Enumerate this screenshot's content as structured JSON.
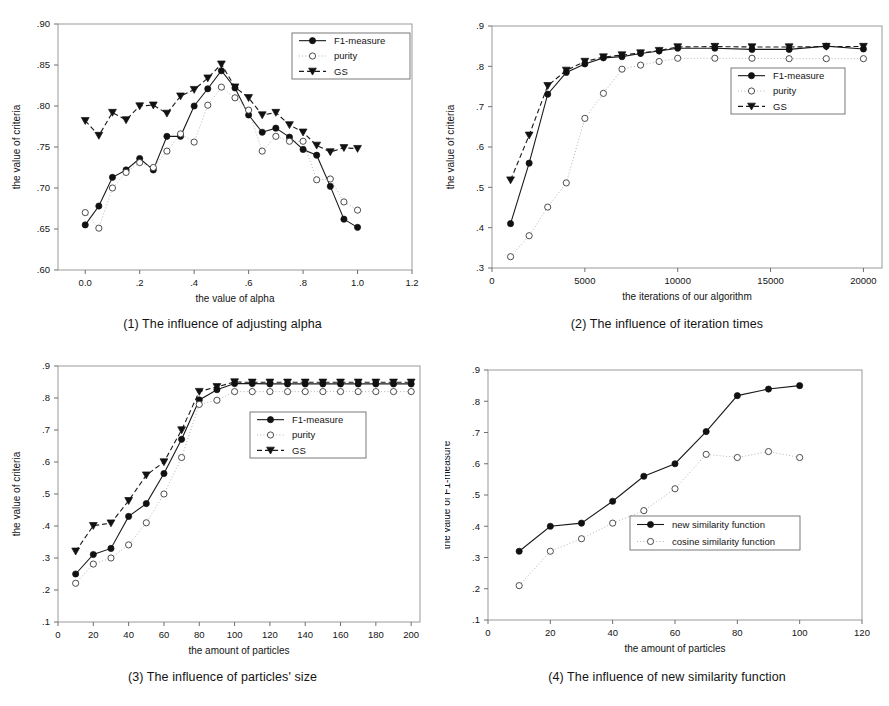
{
  "figure": {
    "title_present": false,
    "panel_count": 4,
    "ink_color": "#141414",
    "dotted_color": "#b4b4b4",
    "frame_color": "#9a9a9a"
  },
  "series_style_names": {
    "solid_filled_circle": "F1-measure",
    "dotted_open_circle": "purity",
    "dashed_filled_triangle": "GS"
  },
  "panels": [
    {
      "id": "panel-1",
      "caption": "(1) The influence of adjusting alpha"
    },
    {
      "id": "panel-2",
      "caption": "(2) The influence of iteration times"
    },
    {
      "id": "panel-3",
      "caption": "(3) The influence of particles' size"
    },
    {
      "id": "panel-4",
      "caption": "(4) The influence of new similarity function"
    }
  ],
  "chart_data": [
    {
      "type": "line",
      "id": "chart-1",
      "title": "(1) The influence of adjusting alpha",
      "xlabel": "the value of alpha",
      "ylabel": "the value of criteria",
      "xlim": [
        -0.1,
        1.2
      ],
      "ylim": [
        0.6,
        0.9
      ],
      "xticks": [
        0.0,
        0.2,
        0.4,
        0.6,
        0.8,
        1.0,
        1.2
      ],
      "xticklabels": [
        "0.0",
        ".2",
        ".4",
        ".6",
        ".8",
        "1.0",
        "1.2"
      ],
      "yticks": [
        0.6,
        0.65,
        0.7,
        0.75,
        0.8,
        0.85,
        0.9
      ],
      "yticklabels": [
        ".60",
        ".65",
        ".70",
        ".75",
        ".80",
        ".85",
        ".90"
      ],
      "grid": false,
      "legend_position": "top-right",
      "x": [
        0.0,
        0.05,
        0.1,
        0.15,
        0.2,
        0.25,
        0.3,
        0.35,
        0.4,
        0.45,
        0.5,
        0.55,
        0.6,
        0.65,
        0.7,
        0.75,
        0.8,
        0.85,
        0.9,
        0.95,
        1.0
      ],
      "series": [
        {
          "name": "F1-measure",
          "marker": "filled-circle",
          "line": "solid",
          "values": [
            0.655,
            0.678,
            0.713,
            0.722,
            0.736,
            0.722,
            0.763,
            0.763,
            0.8,
            0.821,
            0.843,
            0.822,
            0.789,
            0.768,
            0.773,
            0.762,
            0.747,
            0.74,
            0.702,
            0.662,
            0.652
          ]
        },
        {
          "name": "purity",
          "marker": "open-circle",
          "line": "dotted",
          "values": [
            0.67,
            0.651,
            0.7,
            0.719,
            0.731,
            0.725,
            0.745,
            0.766,
            0.756,
            0.801,
            0.823,
            0.81,
            0.795,
            0.745,
            0.763,
            0.757,
            0.757,
            0.71,
            0.711,
            0.683,
            0.673
          ]
        },
        {
          "name": "GS",
          "marker": "filled-triangle",
          "line": "dashed",
          "values": [
            0.782,
            0.764,
            0.792,
            0.783,
            0.8,
            0.801,
            0.791,
            0.812,
            0.82,
            0.834,
            0.851,
            0.823,
            0.81,
            0.789,
            0.792,
            0.777,
            0.768,
            0.752,
            0.744,
            0.749,
            0.748
          ]
        }
      ]
    },
    {
      "type": "line",
      "id": "chart-2",
      "title": "(2) The influence of iteration times",
      "xlabel": "the iterations  of our algorithm",
      "ylabel": "the value of criteria",
      "xlim": [
        0,
        21000
      ],
      "ylim": [
        0.3,
        0.9
      ],
      "xticks": [
        0,
        5000,
        10000,
        15000,
        20000
      ],
      "xticklabels": [
        "0",
        "5000",
        "10000",
        "15000",
        "20000"
      ],
      "yticks": [
        0.3,
        0.4,
        0.5,
        0.6,
        0.7,
        0.8,
        0.9
      ],
      "yticklabels": [
        ".3",
        ".4",
        ".5",
        ".6",
        ".7",
        ".8",
        ".9"
      ],
      "grid": false,
      "legend_position": "middle-right",
      "x": [
        1000,
        2000,
        3000,
        4000,
        5000,
        6000,
        7000,
        8000,
        9000,
        10000,
        12000,
        14000,
        16000,
        18000,
        20000
      ],
      "series": [
        {
          "name": "F1-measure",
          "marker": "filled-circle",
          "line": "solid",
          "values": [
            0.41,
            0.56,
            0.731,
            0.785,
            0.806,
            0.821,
            0.824,
            0.832,
            0.838,
            0.845,
            0.845,
            0.842,
            0.842,
            0.85,
            0.843
          ]
        },
        {
          "name": "purity",
          "marker": "open-circle",
          "line": "dotted",
          "values": [
            0.328,
            0.38,
            0.451,
            0.511,
            0.671,
            0.733,
            0.793,
            0.803,
            0.812,
            0.82,
            0.82,
            0.82,
            0.819,
            0.819,
            0.819
          ]
        },
        {
          "name": "GS",
          "marker": "filled-triangle",
          "line": "dashed",
          "values": [
            0.518,
            0.629,
            0.752,
            0.79,
            0.812,
            0.823,
            0.828,
            0.833,
            0.839,
            0.848,
            0.849,
            0.848,
            0.848,
            0.849,
            0.849
          ]
        }
      ]
    },
    {
      "type": "line",
      "id": "chart-3",
      "title": "(3) The influence of particles' size",
      "xlabel": "the amount of particles",
      "ylabel": "the value of criteria",
      "xlim": [
        0,
        205
      ],
      "ylim": [
        0.1,
        0.9
      ],
      "xticks": [
        0,
        20,
        40,
        60,
        80,
        100,
        120,
        140,
        160,
        180,
        200
      ],
      "xticklabels": [
        "0",
        "20",
        "40",
        "60",
        "80",
        "100",
        "120",
        "140",
        "160",
        "180",
        "200"
      ],
      "yticks": [
        0.1,
        0.2,
        0.3,
        0.4,
        0.5,
        0.6,
        0.7,
        0.8,
        0.9
      ],
      "yticklabels": [
        ".1",
        ".2",
        ".3",
        ".4",
        ".5",
        ".6",
        ".7",
        ".8",
        ".9"
      ],
      "grid": false,
      "legend_position": "middle-right",
      "x": [
        10,
        20,
        30,
        40,
        50,
        60,
        70,
        80,
        90,
        100,
        110,
        120,
        130,
        140,
        150,
        160,
        170,
        180,
        190,
        200
      ],
      "series": [
        {
          "name": "F1-measure",
          "marker": "filled-circle",
          "line": "solid",
          "values": [
            0.25,
            0.311,
            0.33,
            0.43,
            0.47,
            0.564,
            0.671,
            0.794,
            0.826,
            0.845,
            0.845,
            0.844,
            0.844,
            0.844,
            0.844,
            0.844,
            0.844,
            0.844,
            0.844,
            0.844
          ]
        },
        {
          "name": "purity",
          "marker": "open-circle",
          "line": "dotted",
          "values": [
            0.221,
            0.281,
            0.3,
            0.341,
            0.41,
            0.5,
            0.614,
            0.78,
            0.793,
            0.82,
            0.82,
            0.82,
            0.82,
            0.82,
            0.82,
            0.82,
            0.82,
            0.82,
            0.82,
            0.82
          ]
        },
        {
          "name": "GS",
          "marker": "filled-triangle",
          "line": "dashed",
          "values": [
            0.321,
            0.401,
            0.409,
            0.479,
            0.559,
            0.6,
            0.7,
            0.82,
            0.835,
            0.85,
            0.849,
            0.849,
            0.849,
            0.849,
            0.849,
            0.849,
            0.849,
            0.849,
            0.849,
            0.849
          ]
        }
      ]
    },
    {
      "type": "line",
      "id": "chart-4",
      "title": "(4) The influence of new similarity function",
      "xlabel": "the amount of particles",
      "ylabel": "the value of F1-measure",
      "xlim": [
        0,
        120
      ],
      "ylim": [
        0.1,
        0.9
      ],
      "xticks": [
        0,
        20,
        40,
        60,
        80,
        100,
        120
      ],
      "xticklabels": [
        "0",
        "20",
        "40",
        "60",
        "80",
        "100",
        "120"
      ],
      "yticks": [
        0.1,
        0.2,
        0.3,
        0.4,
        0.5,
        0.6,
        0.7,
        0.8,
        0.9
      ],
      "yticklabels": [
        ".1",
        ".2",
        ".3",
        ".4",
        ".5",
        ".6",
        ".7",
        ".8",
        ".9"
      ],
      "grid": false,
      "legend_position": "middle-center",
      "x": [
        10,
        20,
        30,
        40,
        50,
        60,
        70,
        80,
        90,
        100
      ],
      "series": [
        {
          "name": "new similarity function",
          "marker": "filled-circle",
          "line": "solid",
          "values": [
            0.32,
            0.4,
            0.41,
            0.48,
            0.56,
            0.6,
            0.703,
            0.818,
            0.839,
            0.85
          ]
        },
        {
          "name": "cosine similarity function",
          "marker": "open-circle",
          "line": "dotted",
          "values": [
            0.21,
            0.32,
            0.36,
            0.41,
            0.45,
            0.52,
            0.63,
            0.62,
            0.639,
            0.62
          ]
        }
      ]
    }
  ]
}
